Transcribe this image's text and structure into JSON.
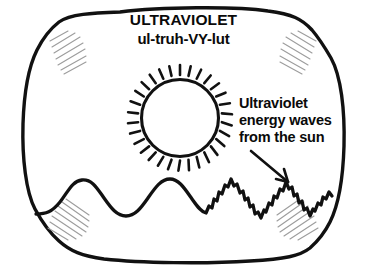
{
  "illustration": {
    "kind": "hand-drawn-diagram",
    "subject": "ultraviolet-light-from-the-sun",
    "frame_shape": "rounded-bulging-screen",
    "ink_color": "#111111",
    "background_color": "#ffffff",
    "hatch_color": "#9a9a9a"
  },
  "heading": {
    "title": "ULTRAVIOLET",
    "pronunciation": "ul-truh-VY-lut"
  },
  "caption": {
    "line1": "Ultraviolet",
    "line2": "energy waves",
    "line3": "from the sun"
  },
  "figures": {
    "sun": {
      "name": "sun-with-rays",
      "cx": 180,
      "cy": 113,
      "radius": 38,
      "ray_count": 28,
      "ray_length": 10,
      "fill": "#ffffff"
    },
    "wave": {
      "name": "energy-wave",
      "description": "two long smooth wavelengths at left transitioning into four short jagged high-frequency wavelengths at right",
      "smooth_wavelengths": 2,
      "jagged_wavelengths": 4,
      "baseline_y": 205,
      "start_x": 36,
      "end_x": 332
    },
    "arrow": {
      "name": "pointer-arrow",
      "from_x": 251,
      "from_y": 151,
      "to_x": 289,
      "to_y": 183,
      "points_to": "jagged high-frequency waves"
    },
    "corner_hatching": {
      "name": "corner-shading-hatch",
      "corners": [
        "top-left",
        "top-right",
        "bottom-left",
        "bottom-right"
      ],
      "lines_per_corner": 7
    }
  }
}
